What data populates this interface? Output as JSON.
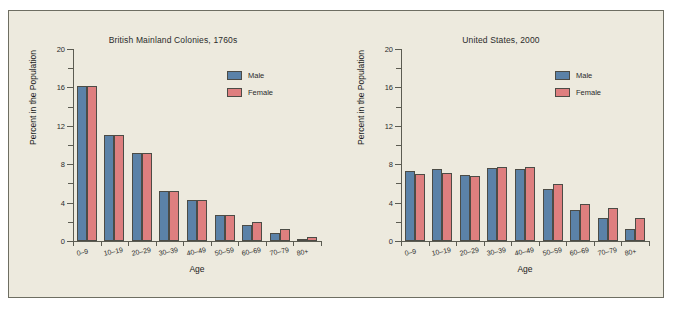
{
  "figure": {
    "background": "#edeade",
    "border_color": "#6e6e62"
  },
  "legend": {
    "male_label": "Male",
    "female_label": "Female",
    "male_color": "#5b82a8",
    "female_color": "#de7f7f"
  },
  "chart_data": [
    {
      "type": "bar",
      "title": "British Mainland Colonies, 1760s",
      "xlabel": "Age",
      "ylabel": "Percent in the Population",
      "categories": [
        "0–9",
        "10–19",
        "20–29",
        "30–39",
        "40–49",
        "50–59",
        "60–69",
        "70–79",
        "80+"
      ],
      "series": [
        {
          "name": "Male",
          "color": "#5b82a8",
          "values": [
            16.1,
            11.0,
            9.2,
            5.2,
            4.3,
            2.7,
            1.7,
            0.8,
            0.2
          ]
        },
        {
          "name": "Female",
          "color": "#de7f7f",
          "values": [
            16.1,
            11.0,
            9.2,
            5.2,
            4.3,
            2.7,
            2.0,
            1.2,
            0.4
          ]
        }
      ],
      "ylim": [
        0,
        20
      ],
      "yticks": [
        0,
        4,
        8,
        12,
        16,
        20
      ],
      "ytick_labels": [
        "0",
        "4",
        "8",
        "12",
        "16",
        "20"
      ],
      "minor_yticks": [
        2,
        6,
        10,
        14,
        18
      ],
      "grid": false,
      "legend_position": "top-right"
    },
    {
      "type": "bar",
      "title": "United States, 2000",
      "xlabel": "Age",
      "ylabel": "Percent in the Population",
      "categories": [
        "0–9",
        "10–19",
        "20–29",
        "30–39",
        "40–49",
        "50–59",
        "60–69",
        "70–79",
        "80+"
      ],
      "series": [
        {
          "name": "Male",
          "color": "#5b82a8",
          "values": [
            7.3,
            7.5,
            6.9,
            7.6,
            7.5,
            5.4,
            3.2,
            2.4,
            1.2
          ]
        },
        {
          "name": "Female",
          "color": "#de7f7f",
          "values": [
            7.0,
            7.1,
            6.8,
            7.7,
            7.7,
            5.9,
            3.9,
            3.4,
            2.4
          ]
        }
      ],
      "ylim": [
        0,
        20
      ],
      "yticks": [
        0,
        4,
        8,
        12,
        16,
        20
      ],
      "ytick_labels": [
        "0",
        "4",
        "8",
        "12",
        "16",
        "20"
      ],
      "minor_yticks": [
        2,
        6,
        10,
        14,
        18
      ],
      "grid": false,
      "legend_position": "top-right"
    }
  ]
}
